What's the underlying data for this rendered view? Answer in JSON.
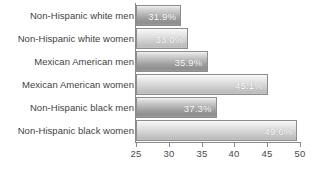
{
  "chart_data": {
    "type": "bar",
    "orientation": "horizontal",
    "title": "",
    "subtitle": "",
    "xlabel": "",
    "ylabel": "",
    "xlim": [
      25,
      50
    ],
    "xticks": [
      "25",
      "30",
      "35",
      "40",
      "45",
      "50"
    ],
    "xtick_values": [
      25,
      30,
      35,
      40,
      45,
      50
    ],
    "grid": false,
    "legend": null,
    "value_label_suffix": "%",
    "categories": [
      "Non-Hispanic white men",
      "Non-Hispanic white women",
      "Mexican American men",
      "Mexican American women",
      "Non-Hispanic black men",
      "Non-Hispanic black women"
    ],
    "values": [
      31.9,
      33.0,
      35.9,
      45.1,
      37.3,
      49.6
    ],
    "value_labels": [
      "31.9%",
      "33.0%",
      "35.9%",
      "45.1%",
      "37.3%",
      "49.6%"
    ],
    "bars": [
      {
        "category": "Non-Hispanic white men",
        "value": 31.9,
        "label": "31.9%",
        "tone": "tone-dark"
      },
      {
        "category": "Non-Hispanic white women",
        "value": 33.0,
        "label": "33.0%",
        "tone": "tone-light"
      },
      {
        "category": "Mexican American men",
        "value": 35.9,
        "label": "35.9%",
        "tone": "tone-dark"
      },
      {
        "category": "Mexican American women",
        "value": 45.1,
        "label": "45.1%",
        "tone": "tone-light"
      },
      {
        "category": "Non-Hispanic black men",
        "value": 37.3,
        "label": "37.3%",
        "tone": "tone-dark"
      },
      {
        "category": "Non-Hispanic black women",
        "value": 49.6,
        "label": "49.6%",
        "tone": "tone-light"
      }
    ],
    "colors": {
      "bar_dark_top": "#f2f2f2",
      "bar_dark_bottom": "#8e8e8e",
      "bar_light_top": "#fafafa",
      "bar_light_bottom": "#bcbcbc",
      "bar_border": "#8d8d8d",
      "axis": "#8a8a8a",
      "value_label_text": "#ffffff",
      "category_label_text": "#3f3f3f",
      "tick_label_text": "#4a4a4a",
      "background": "#ffffff"
    }
  }
}
